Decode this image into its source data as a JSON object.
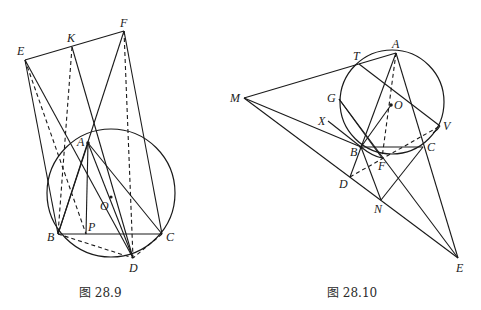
{
  "figures": [
    {
      "id": "fig-28-9",
      "caption": "图 28.9",
      "points": {
        "E": {
          "label": "E",
          "x": 25,
          "y": 60
        },
        "K": {
          "label": "K",
          "x": 72,
          "y": 47
        },
        "F": {
          "label": "F",
          "x": 124,
          "y": 31
        },
        "A": {
          "label": "A",
          "x": 88,
          "y": 143
        },
        "O": {
          "label": "O",
          "x": 111,
          "y": 197
        },
        "B": {
          "label": "B",
          "x": 58,
          "y": 234
        },
        "P": {
          "label": "P",
          "x": 86,
          "y": 234
        },
        "C": {
          "label": "C",
          "x": 162,
          "y": 234
        },
        "D": {
          "label": "D",
          "x": 133,
          "y": 258
        }
      },
      "circle": {
        "cx": 111,
        "cy": 193,
        "r": 64
      }
    },
    {
      "id": "fig-28-10",
      "caption": "图 28.10",
      "points": {
        "A": {
          "label": "A",
          "x": 396,
          "y": 53
        },
        "T": {
          "label": "T",
          "x": 359,
          "y": 64
        },
        "M": {
          "label": "M",
          "x": 244,
          "y": 98
        },
        "G": {
          "label": "G",
          "x": 339,
          "y": 99
        },
        "O": {
          "label": "O",
          "x": 391,
          "y": 105
        },
        "X": {
          "label": "X",
          "x": 328,
          "y": 121
        },
        "V": {
          "label": "V",
          "x": 440,
          "y": 126
        },
        "B": {
          "label": "B",
          "x": 361,
          "y": 147
        },
        "C": {
          "label": "C",
          "x": 423,
          "y": 147
        },
        "F": {
          "label": "F",
          "x": 382,
          "y": 158
        },
        "D": {
          "label": "D",
          "x": 350,
          "y": 177
        },
        "N": {
          "label": "N",
          "x": 381,
          "y": 200
        },
        "E": {
          "label": "E",
          "x": 458,
          "y": 258
        }
      },
      "circle": {
        "cx": 392,
        "cy": 102,
        "r": 52
      }
    }
  ]
}
